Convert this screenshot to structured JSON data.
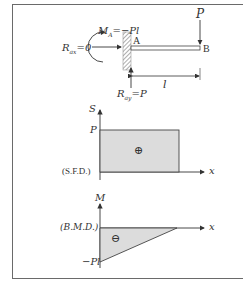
{
  "beam": {
    "moment_label": "M",
    "moment_sub": "A",
    "moment_value": "=−Pl",
    "rax_label": "R",
    "rax_sub": "ax",
    "rax_value": "=0",
    "ray_label": "R",
    "ray_sub": "ay",
    "ray_value": "=P",
    "load_label": "P",
    "point_a": "A",
    "point_b": "B",
    "length_label": "l"
  },
  "sfd": {
    "axis_y_label": "S",
    "axis_x_label": "x",
    "value_label": "P",
    "diagram_label": "(S.F.D.)",
    "sign": "⊕",
    "fill_color": "#dcdcdc"
  },
  "bmd": {
    "axis_y_label": "M",
    "axis_x_label": "x",
    "value_label": "−Pl",
    "diagram_label": "(B.M.D.)",
    "sign": "⊖",
    "fill_color": "#dcdcdc"
  }
}
